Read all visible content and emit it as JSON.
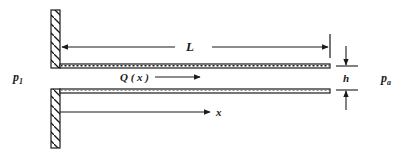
{
  "diagram": {
    "type": "channel-flow schematic",
    "labels": {
      "length": "L",
      "flow": "Q ( x )",
      "axis": "x",
      "gap": "h",
      "pressure_inlet": "p",
      "pressure_inlet_sub": "1",
      "pressure_outlet": "p",
      "pressure_outlet_sub": "a"
    },
    "components": [
      "left-wall-upper",
      "left-wall-lower",
      "upper-plate",
      "lower-plate",
      "length-dimension",
      "gap-dimension",
      "flow-arrow",
      "x-axis-arrow"
    ],
    "colors": {
      "ink": "#1a1a1a",
      "background": "#ffffff"
    }
  }
}
